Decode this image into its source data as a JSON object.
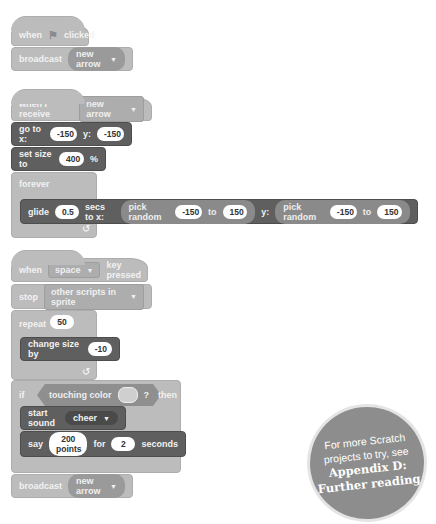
{
  "script1": {
    "when_label": "when",
    "flag_icon": "green-flag-icon",
    "clicked_label": "clicked",
    "broadcast_label": "broadcast",
    "broadcast_value": "new arrow"
  },
  "script2": {
    "when_receive_label": "when I receive",
    "receive_value": "new arrow",
    "goto_label": "go to x:",
    "goto_x": "-150",
    "goto_y_label": "y:",
    "goto_y": "-150",
    "setsize_label": "set size to",
    "setsize_value": "400",
    "setsize_unit": "%",
    "forever_label": "forever",
    "glide_label": "glide",
    "glide_secs": "0.5",
    "glide_secs_label": "secs to x:",
    "pick_random_label": "pick random",
    "x_from": "-150",
    "to_label": "to",
    "x_to": "150",
    "y_label": "y:",
    "y_from": "-150",
    "y_to": "150"
  },
  "script3": {
    "when_label": "when",
    "key_value": "space",
    "key_pressed_label": "key pressed",
    "stop_label": "stop",
    "stop_value": "other scripts in sprite",
    "repeat_label": "repeat",
    "repeat_value": "50",
    "change_size_label": "change size by",
    "change_size_value": "-10",
    "if_label": "if",
    "touching_label": "touching color",
    "question": "?",
    "then_label": "then",
    "start_sound_label": "start sound",
    "sound_value": "cheer",
    "say_label": "say",
    "say_value": "200 points",
    "for_label": "for",
    "say_secs": "2",
    "seconds_label": "seconds",
    "broadcast_label": "broadcast",
    "broadcast_value": "new arrow"
  },
  "badge": {
    "line1": "For more Scratch",
    "line2": "projects to try, see",
    "line3": "Appendix D:",
    "line4": "Further reading"
  },
  "caret": "▼",
  "loop_arrow": "↺"
}
